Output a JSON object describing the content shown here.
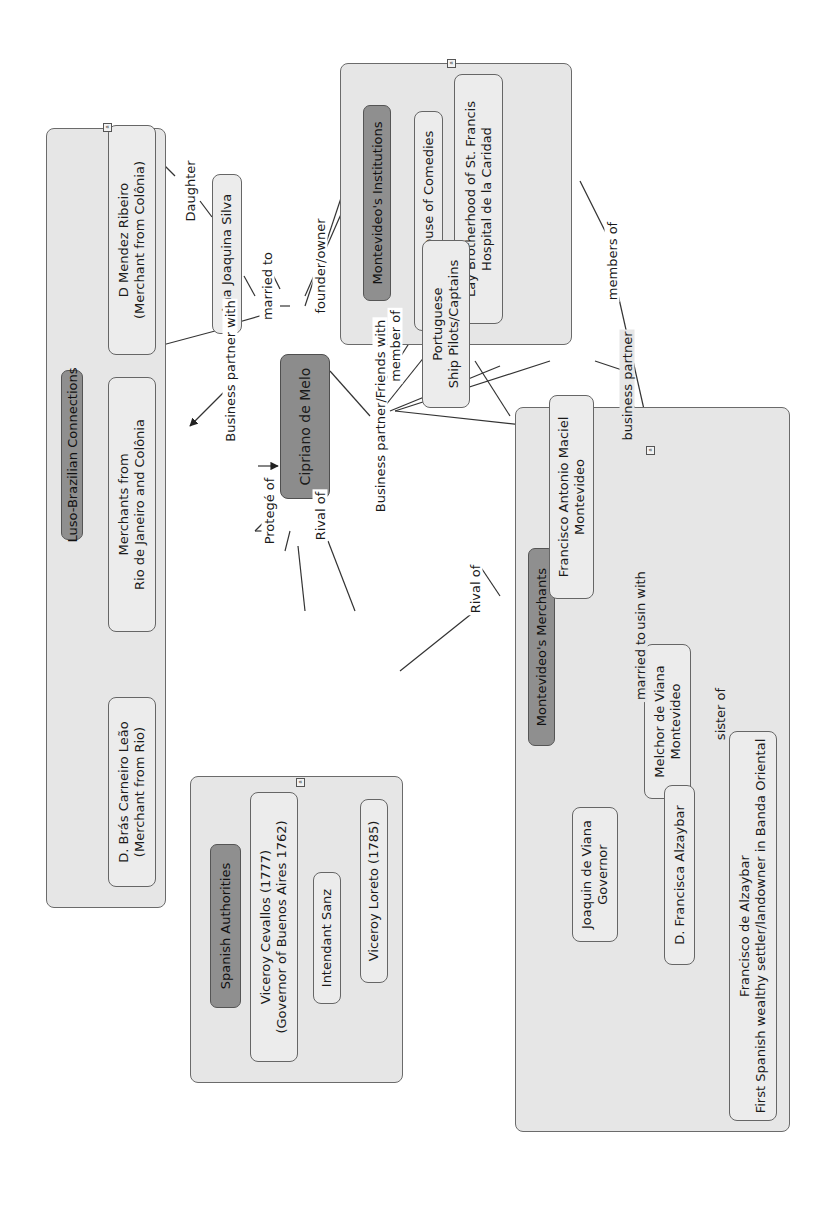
{
  "central": {
    "label": "Cipriano de Melo"
  },
  "groups": {
    "luso_brazilian": {
      "title": "Luso-Brazilian Connections",
      "nodes": [
        "D Mendez Ribeiro\n(Merchant from Colônia)",
        "Merchants from\nRio de Janeiro and Colônia",
        "D. Brás Carneiro Leão\n(Merchant from Rio)"
      ]
    },
    "institutions": {
      "title": "Montevideo's Institutions",
      "nodes": [
        "Theater House of Comedies",
        "Lay Brotherhood of St. Francis\nHospital de la Caridad"
      ]
    },
    "spanish_authorities": {
      "title": "Spanish Authorities",
      "nodes": [
        "Viceroy Cevallos (1777)\n(Governor of Buenos Aires 1762)",
        "Intendant Sanz",
        "Viceroy Loreto (1785)"
      ]
    },
    "merchants": {
      "title": "Montevideo's Merchants",
      "nodes": [
        "Francisco Antonio Maciel\nMontevideo",
        "Melchor de Viana\nMontevideo",
        "Joaquin de Viana\nGovernor",
        "D. Francisca Alzaybar",
        "Francisco de Alzaybar\nFirst Spanish wealthy settler/landowner in Banda Oriental"
      ]
    }
  },
  "standalone_nodes": {
    "ana": "Ana Joaquina Silva",
    "portuguese": "Portuguese\nShip Pilots/Captains"
  },
  "link_labels": {
    "daughter": "Daughter",
    "married_to": "married to",
    "business_partner_with": "Business partner with",
    "founder_owner": "founder/owner",
    "member_of": "member of",
    "members_of": "members of",
    "protege_of": "Protegé of",
    "rival_of_1": "Rival of",
    "rival_of_2": "Rival of",
    "bp_friends_with": "Business partner/Friends with",
    "business_partner": "business partner",
    "cousin_with": "cousin with",
    "married_to_2": "married to",
    "sister_of": "sister of"
  },
  "icons": {
    "collapse": "«"
  },
  "colors": {
    "group_fill": "#e6e6e6",
    "group_title_fill": "#8f8f8f",
    "central_fill": "#8c8c8c",
    "node_fill": "#ececec",
    "line": "#333333"
  }
}
